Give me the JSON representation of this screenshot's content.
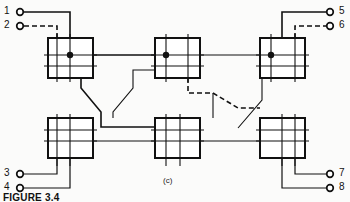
{
  "figure": {
    "caption": "FIGURE 3.4",
    "sub_label": "(c)",
    "line_color": "#111111",
    "dashed_color": "#111111",
    "background_color": "#fbfbfa",
    "box_fill": "#ffffff"
  },
  "terminals": {
    "left": [
      {
        "id": "1",
        "label": "1",
        "x": 20,
        "y": 12,
        "style": "solid"
      },
      {
        "id": "2",
        "label": "2",
        "x": 20,
        "y": 26,
        "style": "dashed"
      },
      {
        "id": "3",
        "label": "3",
        "x": 20,
        "y": 174,
        "style": "solid"
      },
      {
        "id": "4",
        "label": "4",
        "x": 20,
        "y": 188,
        "style": "solid"
      }
    ],
    "right": [
      {
        "id": "5",
        "label": "5",
        "x": 330,
        "y": 12,
        "style": "solid"
      },
      {
        "id": "6",
        "label": "6",
        "x": 330,
        "y": 26,
        "style": "dashed"
      },
      {
        "id": "7",
        "label": "7",
        "x": 330,
        "y": 174,
        "style": "solid"
      },
      {
        "id": "8",
        "label": "8",
        "x": 330,
        "y": 188,
        "style": "solid"
      }
    ]
  },
  "switch_boxes": [
    {
      "name": "stage1-upper",
      "stage": 1,
      "row": "upper",
      "x": 48,
      "y": 38,
      "w": 45,
      "h": 40,
      "has_junction_dot": true
    },
    {
      "name": "stage1-lower",
      "stage": 1,
      "row": "lower",
      "x": 48,
      "y": 118,
      "w": 45,
      "h": 40,
      "has_junction_dot": false
    },
    {
      "name": "stage2-upper",
      "stage": 2,
      "row": "upper",
      "x": 155,
      "y": 38,
      "w": 45,
      "h": 40,
      "has_junction_dot": true
    },
    {
      "name": "stage2-lower",
      "stage": 2,
      "row": "lower",
      "x": 155,
      "y": 118,
      "w": 45,
      "h": 40,
      "has_junction_dot": false
    },
    {
      "name": "stage3-upper",
      "stage": 3,
      "row": "upper",
      "x": 260,
      "y": 38,
      "w": 45,
      "h": 40,
      "has_junction_dot": true
    },
    {
      "name": "stage3-lower",
      "stage": 3,
      "row": "lower",
      "x": 260,
      "y": 118,
      "w": 45,
      "h": 40,
      "has_junction_dot": false
    }
  ],
  "active_path": {
    "description": "dashed route traced from terminal 2 through the network to terminal 6",
    "style": "dashed"
  }
}
